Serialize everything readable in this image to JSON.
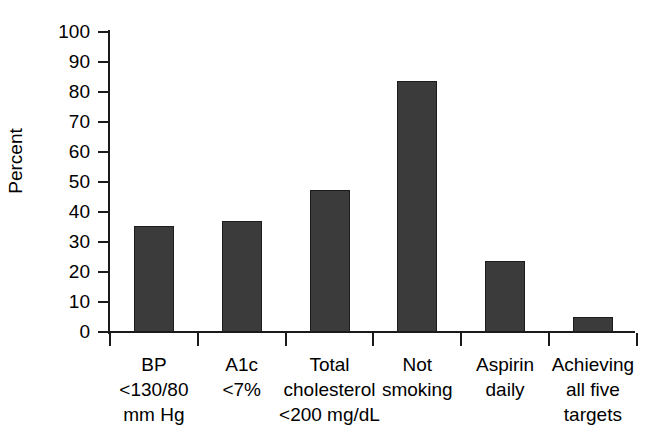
{
  "chart_data": {
    "type": "bar",
    "title": "",
    "subtitle": "",
    "xlabel": "",
    "ylabel": "Percent",
    "ylim": [
      0,
      100
    ],
    "ytick_step": 10,
    "yticks": [
      100,
      90,
      80,
      70,
      60,
      50,
      40,
      30,
      20,
      10,
      0
    ],
    "ytick_labels": [
      "100",
      "90",
      "80",
      "70",
      "60",
      "50",
      "40",
      "30",
      "20",
      "10",
      "0"
    ],
    "grid": false,
    "legend": null,
    "bar_color": "#3b3b3b",
    "bar_edge_color": "#1c1c1c",
    "axis_color": "#1a1a1a",
    "categories": [
      "BP <130/80 mm Hg",
      "A1c <7%",
      "Total cholesterol <200 mg/dL",
      "Not smoking",
      "Aspirin daily",
      "Achieving all five targets"
    ],
    "category_label_lines": [
      [
        "BP",
        "<130/80",
        "mm Hg"
      ],
      [
        "A1c",
        "<7%"
      ],
      [
        "Total",
        "cholesterol",
        "<200 mg/dL"
      ],
      [
        "Not",
        "smoking"
      ],
      [
        "Aspirin",
        "daily"
      ],
      [
        "Achieving",
        "all five",
        "targets"
      ]
    ],
    "values": [
      35.3,
      37.0,
      47.3,
      83.7,
      23.7,
      5.0
    ]
  }
}
